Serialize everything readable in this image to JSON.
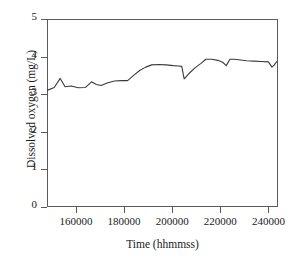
{
  "chart_data": {
    "type": "line",
    "title": "",
    "subtitle": "",
    "xlabel": "Time (hhmmss)",
    "ylabel": "Dissolved oxygen (mg/L)",
    "xlim": [
      148000,
      244000
    ],
    "ylim": [
      0,
      5
    ],
    "xticks": [
      160000,
      180000,
      200000,
      220000,
      240000
    ],
    "xtick_labels": [
      "160000",
      "180000",
      "200000",
      "220000",
      "240000"
    ],
    "yticks": [
      0,
      1,
      2,
      3,
      4,
      5
    ],
    "ytick_labels": [
      "0",
      "1",
      "2",
      "3",
      "4",
      "5"
    ],
    "grid": false,
    "legend": false,
    "legend_position": "none",
    "line_color": "#3a3a3a",
    "line_width": 1.1,
    "frame_color": "#5a5a5a",
    "background": "#ffffff",
    "series": [
      {
        "name": "Dissolved oxygen",
        "x": [
          148000,
          151000,
          153500,
          155500,
          158000,
          161000,
          164000,
          166500,
          168500,
          170500,
          173000,
          176000,
          179000,
          181500,
          184000,
          186500,
          189000,
          191500,
          194500,
          197500,
          200500,
          202500,
          204000,
          205000,
          207000,
          209500,
          212000,
          214000,
          216500,
          219000,
          221000,
          222500,
          224000,
          226000,
          228500,
          231000,
          234000,
          237000,
          240000,
          241500,
          242500,
          243500
        ],
        "y": [
          3.1,
          3.18,
          3.42,
          3.2,
          3.22,
          3.17,
          3.18,
          3.33,
          3.26,
          3.23,
          3.3,
          3.35,
          3.36,
          3.36,
          3.5,
          3.63,
          3.72,
          3.78,
          3.79,
          3.78,
          3.76,
          3.75,
          3.74,
          3.41,
          3.55,
          3.7,
          3.82,
          3.93,
          3.93,
          3.9,
          3.85,
          3.76,
          3.93,
          3.93,
          3.91,
          3.89,
          3.88,
          3.87,
          3.86,
          3.72,
          3.78,
          3.87
        ]
      }
    ]
  },
  "axes": {
    "x_axis_name": "time-axis",
    "y_axis_name": "dissolved-oxygen-axis"
  }
}
